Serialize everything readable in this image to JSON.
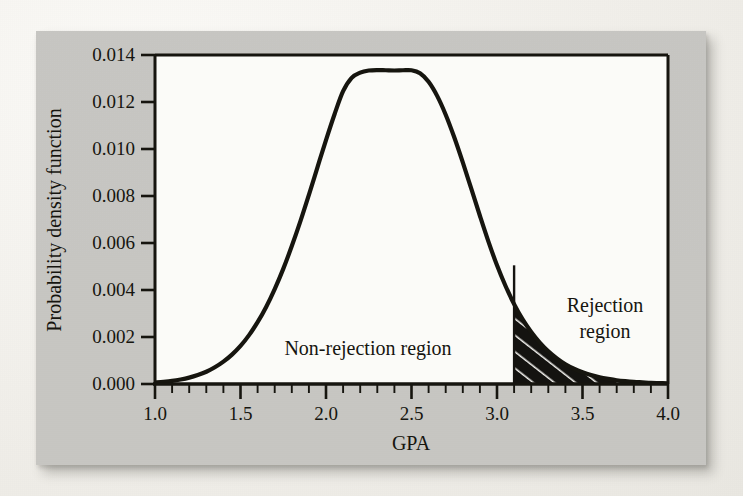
{
  "figure": {
    "background_color": "#c9c8c4",
    "page_color": "#f2f0ec",
    "plot_area_color": "#fbfbf8",
    "ink_color": "#16150f"
  },
  "chart_data": {
    "type": "area",
    "title": "",
    "subtitle": "",
    "xlabel": "GPA",
    "ylabel": "Probability density function",
    "xlim": [
      1.0,
      4.0
    ],
    "ylim": [
      0.0,
      0.014
    ],
    "grid": false,
    "legend_position": "none",
    "x_tick_labels": [
      "1.0",
      "1.5",
      "2.0",
      "2.5",
      "3.0",
      "3.5",
      "4.0"
    ],
    "x_tick_values": [
      1.0,
      1.5,
      2.0,
      2.5,
      3.0,
      3.5,
      4.0
    ],
    "x_minor_tick_step": 0.1,
    "y_tick_labels": [
      "0.000",
      "0.002",
      "0.004",
      "0.006",
      "0.008",
      "0.010",
      "0.012",
      "0.014"
    ],
    "y_tick_values": [
      0.0,
      0.002,
      0.004,
      0.006,
      0.008,
      0.01,
      0.012,
      0.014
    ],
    "series": [
      {
        "name": "Probability density function",
        "distribution": "normal-like",
        "peak_x": 2.5,
        "peak_y": 0.01335,
        "x": [
          1.0,
          1.05,
          1.1,
          1.15,
          1.2,
          1.25,
          1.3,
          1.35,
          1.4,
          1.45,
          1.5,
          1.55,
          1.6,
          1.65,
          1.7,
          1.75,
          1.8,
          1.85,
          1.9,
          1.95,
          2.0,
          2.05,
          2.1,
          2.15,
          2.2,
          2.25,
          2.3,
          2.35,
          2.4,
          2.45,
          2.5,
          2.55,
          2.6,
          2.65,
          2.7,
          2.75,
          2.8,
          2.85,
          2.9,
          2.95,
          3.0,
          3.05,
          3.1,
          3.15,
          3.2,
          3.25,
          3.3,
          3.35,
          3.4,
          3.45,
          3.5,
          3.55,
          3.6,
          3.65,
          3.7,
          3.75,
          3.8,
          3.85,
          3.9,
          3.95,
          4.0
        ],
        "y": [
          6e-05,
          9e-05,
          0.00013,
          0.00019,
          0.00027,
          0.00038,
          0.00052,
          0.00071,
          0.00095,
          0.00125,
          0.00162,
          0.00208,
          0.00263,
          0.00328,
          0.00404,
          0.0049,
          0.00587,
          0.00692,
          0.00805,
          0.00922,
          0.01038,
          0.01148,
          0.01246,
          0.01303,
          0.01325,
          0.01334,
          0.01336,
          0.01335,
          0.01334,
          0.01335,
          0.01335,
          0.01322,
          0.01286,
          0.01226,
          0.01146,
          0.0105,
          0.00943,
          0.0083,
          0.00716,
          0.00606,
          0.00505,
          0.00417,
          0.0034,
          0.00275,
          0.00221,
          0.00176,
          0.00139,
          0.00109,
          0.00084,
          0.00065,
          0.0005,
          0.00038,
          0.00029,
          0.00022,
          0.00016,
          0.00012,
          9e-05,
          7e-05,
          5e-05,
          4e-05,
          3e-05
        ]
      }
    ],
    "shaded_region": {
      "label": "Rejection region",
      "x_start": 3.1,
      "x_end": 4.0,
      "boundary_value_y": 0.00505,
      "fill": "#141310",
      "hatch": "white-diagonal"
    },
    "annotations": [
      {
        "id": "non-rejection",
        "text": "Non-rejection region",
        "x": 2.18,
        "y": 0.00175,
        "lines": [
          "Non-rejection region"
        ]
      },
      {
        "id": "rejection",
        "text": "Rejection region",
        "x": 3.63,
        "y": 0.00315,
        "lines": [
          "Rejection",
          "region"
        ]
      }
    ]
  },
  "labels": {
    "y_axis_title": "Probability density function",
    "x_axis_title": "GPA",
    "non_rejection_region": "Non-rejection region",
    "rejection_region_line1": "Rejection",
    "rejection_region_line2": "region"
  }
}
